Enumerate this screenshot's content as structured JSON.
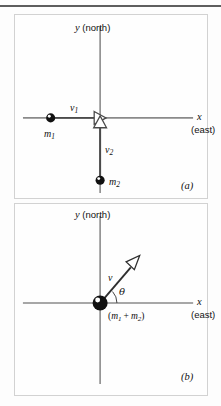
{
  "figure": {
    "type": "physics-vector-diagram",
    "background_color": "#fdfdfd",
    "rule_color": "#5e5e5e",
    "panel_border_color": "#d2d2d2",
    "axis_color": "#8a8a8a",
    "vector_color": "#4a4a4a",
    "ball_color": "#111111"
  },
  "panels": [
    {
      "id": "a",
      "label": "(a)",
      "axes": {
        "y_label_symbol": "y",
        "y_label_text": "(north)",
        "x_label_symbol": "x",
        "x_label_text": "(east)"
      },
      "bodies": [
        {
          "name": "m1",
          "symbol": "m",
          "subscript": "1",
          "position": "left of origin on x-axis"
        },
        {
          "name": "m2",
          "symbol": "m",
          "subscript": "2",
          "position": "below origin on y-axis"
        }
      ],
      "vectors": [
        {
          "name": "v1",
          "symbol": "v",
          "subscript": "1",
          "direction": "+x (east)",
          "from": "m1",
          "to": "origin"
        },
        {
          "name": "v2",
          "symbol": "v",
          "subscript": "2",
          "direction": "+y (north)",
          "from": "m2",
          "to": "origin"
        }
      ]
    },
    {
      "id": "b",
      "label": "(b)",
      "axes": {
        "y_label_symbol": "y",
        "y_label_text": "(north)",
        "x_label_symbol": "x",
        "x_label_text": "(east)"
      },
      "bodies": [
        {
          "name": "combined-mass",
          "label_open": "(",
          "label_m1": "m",
          "label_m1_sub": "1",
          "label_op": " + ",
          "label_m2": "m",
          "label_m2_sub": "2",
          "label_close": ")",
          "position": "at origin"
        }
      ],
      "vectors": [
        {
          "name": "v",
          "symbol": "v",
          "direction": "up and to the right",
          "angle_symbol": "θ",
          "angle_label": "θ",
          "from": "origin"
        }
      ]
    }
  ],
  "labels": {
    "y_symbol": "y",
    "y_text": "(north)",
    "x_symbol": "x",
    "x_text": "(east)",
    "v1": "v",
    "v1_sub": "1",
    "v2": "v",
    "v2_sub": "2",
    "v": "v",
    "m1": "m",
    "m1_sub": "1",
    "m2": "m",
    "m2_sub": "2",
    "theta": "θ",
    "panel_a": "(a)",
    "panel_b": "(b)",
    "combined_open": "(",
    "combined_m1": "m",
    "combined_m1_sub": "1",
    "combined_op": "+",
    "combined_m2": "m",
    "combined_m2_sub": "2",
    "combined_close": ")"
  }
}
